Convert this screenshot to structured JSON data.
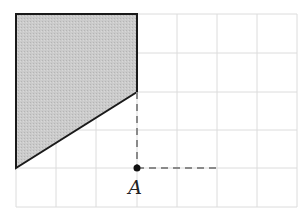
{
  "diagram": {
    "grid": {
      "x_lines": [
        16,
        56,
        96,
        137,
        177,
        217,
        257,
        297
      ],
      "y_lines": [
        14,
        53,
        92,
        130,
        168,
        207
      ],
      "color": "#dcdcdc"
    },
    "shape": {
      "points": "16,14 137,14 137,92 16,168",
      "fill": "#c9c9c9",
      "stroke": "#1a1a1a"
    },
    "dashed_lines": [
      {
        "x1": 137,
        "y1": 92,
        "x2": 137,
        "y2": 168
      },
      {
        "x1": 137,
        "y1": 168,
        "x2": 217,
        "y2": 168
      }
    ],
    "dash_color": "#8a8a8a",
    "point": {
      "x": 137,
      "y": 168,
      "label": "A"
    }
  }
}
